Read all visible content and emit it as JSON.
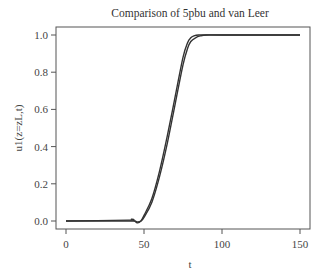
{
  "chart_data": {
    "type": "line",
    "title": "Comparison of 5pbu and van Leer",
    "xlabel": "t",
    "ylabel": "u1(z=zL,t)",
    "xlim": [
      0,
      150
    ],
    "ylim": [
      0.0,
      1.0
    ],
    "xticks": [
      "0",
      "50",
      "100",
      "150"
    ],
    "yticks": [
      "0.0",
      "0.2",
      "0.4",
      "0.6",
      "0.8",
      "1.0"
    ],
    "grid": false,
    "legend": "none",
    "series": [
      {
        "name": "5pbu",
        "x": [
          0,
          40,
          42,
          44,
          46,
          48,
          50,
          55,
          60,
          65,
          70,
          75,
          78,
          80,
          82,
          85,
          90,
          100,
          150
        ],
        "y": [
          0.0,
          0.005,
          0.01,
          0.0,
          -0.01,
          0.0,
          0.03,
          0.12,
          0.27,
          0.46,
          0.67,
          0.88,
          0.96,
          0.985,
          0.995,
          1.0,
          1.0,
          1.0,
          1.0
        ]
      },
      {
        "name": "van Leer",
        "x": [
          0,
          40,
          44,
          46,
          48,
          50,
          55,
          60,
          65,
          70,
          75,
          78,
          80,
          83,
          86,
          90,
          100,
          150
        ],
        "y": [
          0.0,
          0.0,
          0.0,
          -0.005,
          0.0,
          0.02,
          0.1,
          0.24,
          0.42,
          0.63,
          0.84,
          0.93,
          0.965,
          0.985,
          0.995,
          1.0,
          1.0,
          1.0
        ]
      }
    ]
  }
}
